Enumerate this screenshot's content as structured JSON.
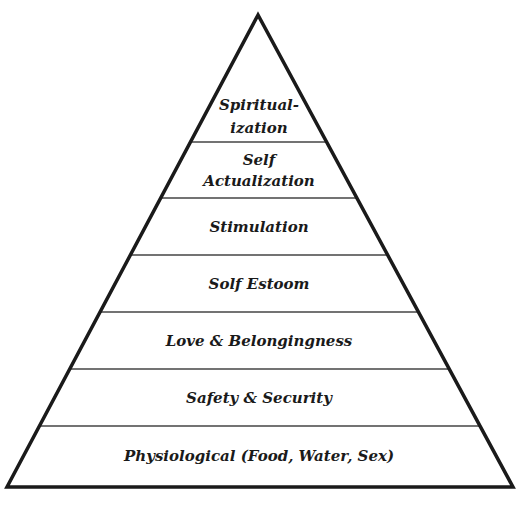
{
  "diagram": {
    "type": "pyramid",
    "shape": {
      "apex": [
        258,
        15
      ],
      "bottom_left": [
        7,
        487
      ],
      "bottom_right": [
        513,
        487
      ]
    },
    "colors": {
      "outline": "#1a1a1a",
      "divider": "#444444",
      "text": "#1a1a1a",
      "fill": "#ffffff"
    },
    "dividers_y": [
      142,
      198,
      255,
      312,
      369,
      426
    ],
    "levels": [
      {
        "lines": [
          "Spiritual-",
          "ization"
        ],
        "y": [
          110,
          133
        ],
        "size": 15
      },
      {
        "lines": [
          "Self",
          "Actualization"
        ],
        "y": [
          165,
          186
        ],
        "size": 15
      },
      {
        "lines": [
          "Stimulation"
        ],
        "y": [
          232
        ],
        "size": 15
      },
      {
        "lines": [
          "Solf Estoom"
        ],
        "y": [
          289
        ],
        "size": 15
      },
      {
        "lines": [
          "Love & Belongingness"
        ],
        "y": [
          346
        ],
        "size": 15
      },
      {
        "lines": [
          "Safety & Security"
        ],
        "y": [
          403
        ],
        "size": 15
      },
      {
        "lines": [
          "Physiological (Food, Water, Sex)"
        ],
        "y": [
          461
        ],
        "size": 15
      }
    ]
  }
}
